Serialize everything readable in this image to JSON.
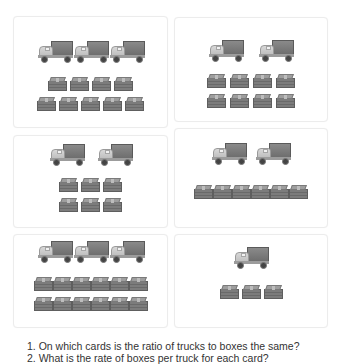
{
  "cards": [
    {
      "id": 1,
      "trucks": 3,
      "box_rows": [
        4,
        5
      ]
    },
    {
      "id": 2,
      "trucks": 2,
      "box_rows": [
        4,
        4
      ]
    },
    {
      "id": 3,
      "trucks": 2,
      "box_rows": [
        3,
        3
      ]
    },
    {
      "id": 4,
      "trucks": 2,
      "box_rows": [
        6
      ]
    },
    {
      "id": 5,
      "trucks": 3,
      "box_rows": [
        6,
        6
      ]
    },
    {
      "id": 6,
      "trucks": 1,
      "box_rows": [
        3
      ]
    }
  ],
  "icons": {
    "truck": "truck-icon",
    "box": "box-icon"
  },
  "questions": [
    "1. On which cards is the ratio of trucks to boxes the same?",
    "2. What is the rate of boxes per truck for each card?"
  ]
}
